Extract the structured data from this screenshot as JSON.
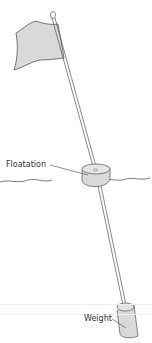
{
  "diagram": {
    "type": "labeled-illustration",
    "labels": {
      "floatation": "Floatation",
      "weight": "Weight"
    },
    "colors": {
      "line": "#555555",
      "fill": "#d9d9d9",
      "text": "#333333",
      "background": "#ffffff"
    }
  }
}
